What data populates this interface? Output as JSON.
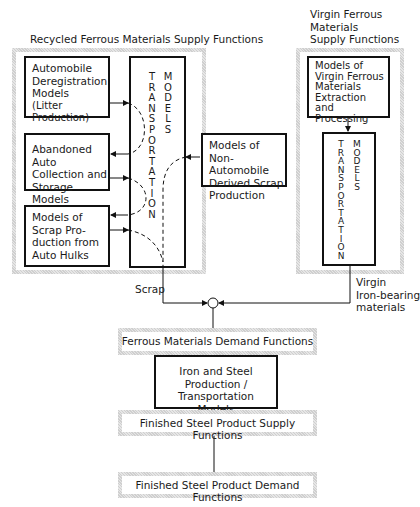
{
  "recycled_panel": {
    "title": "Recycled Ferrous Materials Supply Functions",
    "boxes": {
      "deregistration": [
        "Automobile",
        "Deregistration",
        "Models",
        "(Litter Production)"
      ],
      "abandoned": [
        "Abandoned Auto",
        "Collection and",
        "Storage Models"
      ],
      "hulks": [
        "Models of",
        "Scrap Pro-",
        "duction from",
        "Auto Hulks"
      ],
      "non_auto": [
        "Models of",
        "Non-Automobile",
        "Derived Scrap",
        "Production"
      ]
    },
    "transport": {
      "col1": "T\nR\nA\nN\nS\nP\nO\nR\nT\nA\nT\nI\nO\nN",
      "col2": "M\nO\nD\nE\nL\nS"
    }
  },
  "virgin_panel": {
    "title": [
      "Virgin Ferrous",
      "Materials",
      "Supply Functions"
    ],
    "boxes": {
      "extraction": [
        "Models of",
        "Virgin Ferrous",
        "Materials",
        "Extraction and",
        "Processing"
      ]
    },
    "transport": {
      "col1": "T\nR\nA\nN\nS\nP\nO\nR\nT\nA\nT\nI\nO\nN",
      "col2": "M\nO\nD\nE\nL\nS"
    }
  },
  "flows": {
    "scrap_label": "Scrap",
    "virgin_label": [
      "Virgin",
      "Iron-bearing",
      "materials"
    ]
  },
  "lower": {
    "ferrous_demand": "Ferrous Materials Demand Functions",
    "iron_steel": [
      "Iron and Steel",
      "Production / Transportation",
      "Models"
    ],
    "finished_supply": "Finished Steel Product Supply Functions",
    "finished_demand": "Finished Steel Product Demand Functions"
  },
  "colors": {
    "line": "#111111",
    "hatch": "#d9d9d9"
  }
}
